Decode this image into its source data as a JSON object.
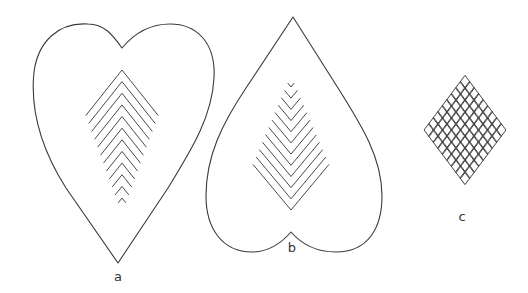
{
  "figure": {
    "colors": {
      "line": "#3a3a3a",
      "background": "#ffffff"
    },
    "panels": [
      {
        "id": "a",
        "label": "a",
        "shape": "heart-upright",
        "infill": "chevrons-pointing-up",
        "chevron_count": 12
      },
      {
        "id": "b",
        "label": "b",
        "shape": "heart-inverted",
        "infill": "chevrons-pointing-down",
        "chevron_count": 12
      },
      {
        "id": "c",
        "label": "c",
        "shape": "diamond",
        "infill": "diamond-lattice",
        "lattice_rows": 9
      }
    ]
  }
}
